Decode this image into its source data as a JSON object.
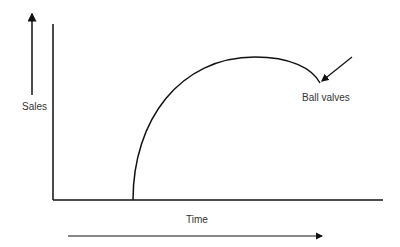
{
  "diagram": {
    "y_label": "Sales",
    "x_label": "Time",
    "annotation": "Ball valves",
    "curve_description": "Product life cycle curve: rises steeply from zero, peaks, then declines slightly",
    "colors": {
      "line": "#111111",
      "text": "#333333",
      "background": "#ffffff"
    }
  }
}
